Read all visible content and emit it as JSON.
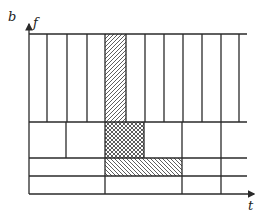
{
  "figure": {
    "panel_label": "b",
    "y_axis_label": "f",
    "x_axis_label": "t",
    "line_color": "#2a2a2a",
    "hatch_color": "#333333",
    "rows": [
      {
        "name": "wideband-row",
        "y_top": 34,
        "y_bottom": 122,
        "dividers_x": [
          47,
          67,
          87,
          105,
          126,
          145,
          164,
          183,
          202,
          221,
          239
        ]
      },
      {
        "name": "mid-row",
        "y_top": 122,
        "y_bottom": 158,
        "dividers_x": [
          66,
          105,
          144,
          182,
          221
        ]
      },
      {
        "name": "narrow-row-1",
        "y_top": 158,
        "y_bottom": 176,
        "dividers_x": [
          105,
          182,
          221
        ]
      },
      {
        "name": "narrow-row-2",
        "y_top": 176,
        "y_bottom": 194,
        "dividers_x": [
          105,
          182,
          221
        ]
      }
    ],
    "highlighted_cells": [
      {
        "name": "hatched-forward-cell",
        "pattern": "forward-diagonal",
        "x": 105,
        "y": 34,
        "w": 21,
        "h": 88
      },
      {
        "name": "crosshatched-cell",
        "pattern": "cross-hatch",
        "x": 105,
        "y": 122,
        "w": 39,
        "h": 36
      },
      {
        "name": "hatched-backward-cell",
        "pattern": "backward-diagonal",
        "x": 105,
        "y": 158,
        "w": 77,
        "h": 18
      }
    ]
  }
}
